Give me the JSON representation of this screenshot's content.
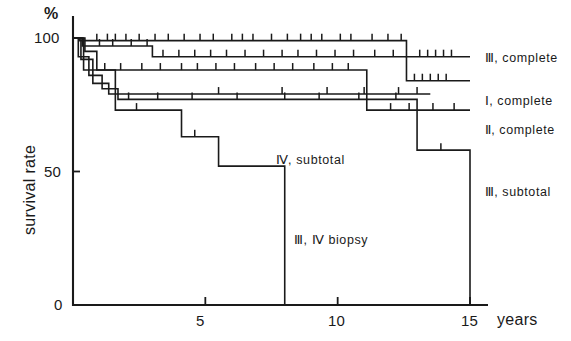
{
  "chart_data": {
    "type": "line",
    "title": "",
    "xlabel": "years",
    "ylabel": "survival rate",
    "yunit": "%",
    "xlim": [
      0,
      15
    ],
    "ylim": [
      0,
      100
    ],
    "xticks": [
      0,
      5,
      10,
      15
    ],
    "xtick_labels": [
      "0",
      "5",
      "10",
      "15"
    ],
    "yticks": [
      0,
      50,
      100
    ],
    "ytick_labels": [
      "0",
      "50",
      "100"
    ],
    "grid": false,
    "legend_position": "inline-right",
    "note": "Kaplan-Meier survival curves with censoring tick marks above each step line",
    "series": [
      {
        "name": "III, complete",
        "label": "Ⅲ, complete",
        "label_x": 15.4,
        "label_y": 92,
        "color": "#1a1a1a",
        "steps": [
          [
            0,
            100
          ],
          [
            0.25,
            100
          ],
          [
            0.25,
            99
          ],
          [
            12.6,
            99
          ],
          [
            12.6,
            93
          ],
          [
            15.0,
            93
          ]
        ],
        "censor_marks": [
          0.9,
          1.3,
          1.6,
          2.0,
          2.5,
          3.1,
          3.6,
          4.2,
          4.8,
          5.3,
          6.0,
          6.4,
          6.8,
          7.5,
          8.1,
          8.6,
          9.0,
          9.4,
          10.1,
          10.5,
          11.3,
          11.9,
          12.4,
          13.1,
          13.4,
          13.7,
          14.0,
          14.3
        ]
      },
      {
        "name": "I, complete",
        "label": "Ⅰ, complete",
        "label_x": 15.4,
        "label_y": 76,
        "color": "#1a1a1a",
        "steps": [
          [
            0,
            100
          ],
          [
            0.35,
            100
          ],
          [
            0.35,
            97
          ],
          [
            3.0,
            97
          ],
          [
            3.0,
            93
          ],
          [
            12.6,
            93
          ],
          [
            12.6,
            84
          ],
          [
            15.0,
            84
          ]
        ],
        "censor_marks": [
          1.0,
          1.5,
          2.2,
          2.8,
          3.4,
          4.0,
          4.6,
          5.2,
          5.8,
          6.5,
          7.2,
          7.9,
          8.5,
          9.2,
          9.9,
          10.6,
          11.4,
          12.1,
          12.9,
          13.2,
          13.5,
          13.8,
          14.1
        ]
      },
      {
        "name": "II, complete",
        "label": "Ⅱ, complete",
        "label_x": 15.4,
        "label_y": 65,
        "color": "#1a1a1a",
        "steps": [
          [
            0,
            100
          ],
          [
            0.45,
            100
          ],
          [
            0.45,
            95
          ],
          [
            0.9,
            95
          ],
          [
            0.9,
            88
          ],
          [
            11.1,
            88
          ],
          [
            11.1,
            73
          ],
          [
            15.0,
            73
          ]
        ],
        "censor_marks": [
          1.2,
          1.8,
          2.6,
          3.3,
          4.1,
          4.7,
          5.4,
          6.1,
          6.9,
          7.6,
          8.3,
          9.1,
          9.8,
          10.4,
          12.0,
          12.7,
          13.6,
          14.4
        ]
      },
      {
        "name": "IV, subtotal",
        "label": "Ⅳ, subtotal",
        "label_x": 7.5,
        "label_y": 54,
        "color": "#1a1a1a",
        "steps": [
          [
            0,
            100
          ],
          [
            0.3,
            100
          ],
          [
            0.3,
            92
          ],
          [
            0.75,
            92
          ],
          [
            0.75,
            83
          ],
          [
            1.35,
            83
          ],
          [
            1.35,
            79
          ],
          [
            13.5,
            79
          ]
        ],
        "censor_marks": [
          5.5,
          7.9,
          9.6,
          11.0,
          12.3,
          13.0
        ]
      },
      {
        "name": "III, subtotal",
        "label": "Ⅲ, subtotal",
        "label_x": 15.4,
        "label_y": 42,
        "color": "#1a1a1a",
        "steps": [
          [
            0,
            100
          ],
          [
            0.2,
            100
          ],
          [
            0.2,
            93
          ],
          [
            0.6,
            93
          ],
          [
            0.6,
            86
          ],
          [
            1.1,
            86
          ],
          [
            1.1,
            81
          ],
          [
            1.7,
            81
          ],
          [
            1.7,
            77
          ],
          [
            13.0,
            77
          ],
          [
            13.0,
            58
          ],
          [
            15.0,
            58
          ],
          [
            15.0,
            0
          ]
        ],
        "censor_marks": [
          2.1,
          3.2,
          4.5,
          6.2,
          8.0,
          9.3,
          10.8,
          12.2,
          13.9
        ]
      },
      {
        "name": "III, IV biopsy",
        "label": "Ⅲ, Ⅳ biopsy",
        "label_x": 8.2,
        "label_y": 24,
        "color": "#1a1a1a",
        "steps": [
          [
            0,
            100
          ],
          [
            0.4,
            100
          ],
          [
            0.4,
            88
          ],
          [
            1.6,
            88
          ],
          [
            1.6,
            73
          ],
          [
            4.1,
            73
          ],
          [
            4.1,
            63
          ],
          [
            5.5,
            63
          ],
          [
            5.5,
            52
          ],
          [
            8.0,
            52
          ],
          [
            8.0,
            0
          ]
        ],
        "censor_marks": [
          2.4,
          4.6
        ]
      }
    ]
  },
  "axes": {
    "y_unit_label": "%",
    "y_title": "survival rate",
    "x_title": "years",
    "y_tick_100": "100",
    "y_tick_50": "50",
    "y_tick_0": "0",
    "x_tick_0": "0",
    "x_tick_5": "5",
    "x_tick_10": "10",
    "x_tick_15": "15"
  }
}
